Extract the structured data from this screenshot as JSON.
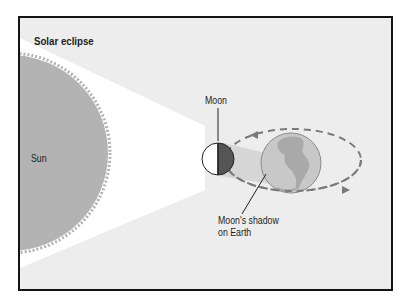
{
  "diagram": {
    "title": "Solar eclipse",
    "labels": {
      "sun": "Sun",
      "moon": "Moon",
      "shadow_line1": "Moon's shadow",
      "shadow_line2": "on Earth"
    },
    "colors": {
      "background": "#ededed",
      "border": "#141414",
      "sun": "#b3b3b3",
      "light_cone": "#ffffff",
      "moon_lit": "#ffffff",
      "moon_dark": "#555555",
      "shadow_cone": "#d6d6d6",
      "earth_ocean": "#c8c8c8",
      "earth_land": "#a9a9a9",
      "orbit": "#7a7a7a"
    },
    "icons": {
      "sun": "sun-disc-icon",
      "moon": "moon-half-lit-icon",
      "earth": "earth-globe-icon",
      "orbit_arrow_top": "arrow-left-icon",
      "orbit_arrow_bottom": "arrow-right-icon"
    }
  }
}
